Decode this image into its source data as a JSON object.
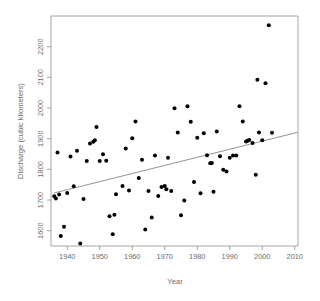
{
  "chart_data": {
    "type": "scatter",
    "title": "",
    "xlabel": "Year",
    "ylabel": "Discharge (cubic kilometers)",
    "xlim": [
      1935,
      2011
    ],
    "ylim": [
      1550,
      2300
    ],
    "grid": false,
    "legend": null,
    "xticks": [
      1940,
      1950,
      1960,
      1970,
      1980,
      1990,
      2000,
      2010
    ],
    "xtick_labels": [
      "1940",
      "1950",
      "1960",
      "1970",
      "1980",
      "1990",
      "2000",
      "2010"
    ],
    "yticks": [
      1600,
      1700,
      1800,
      1900,
      2000,
      2100,
      2200
    ],
    "ytick_labels": [
      "1600",
      "1700",
      "1800",
      "1900",
      "2000",
      "2100",
      "2200"
    ],
    "point_color": "#000000",
    "point_size": 2.0,
    "trend": {
      "name": "linear-regression-line",
      "color": "#777777",
      "x_start": 1936,
      "y_start": 1723,
      "x_end": 2011,
      "y_end": 1921
    },
    "x": [
      1936,
      1936.5,
      1937,
      1937.5,
      1938,
      1939,
      1940,
      1941,
      1942,
      1943,
      1944,
      1945,
      1946,
      1947,
      1948,
      1948.5,
      1949,
      1950,
      1951,
      1952,
      1953,
      1954,
      1954.5,
      1955,
      1957,
      1958,
      1959,
      1960,
      1961,
      1962,
      1963,
      1964,
      1965,
      1966,
      1967,
      1968,
      1969,
      1970,
      1970.5,
      1971,
      1972,
      1973,
      1974,
      1975,
      1976,
      1977,
      1978,
      1979,
      1980,
      1981,
      1982,
      1983,
      1984,
      1984.5,
      1985,
      1986,
      1987,
      1988,
      1989,
      1990,
      1991,
      1992,
      1993,
      1994,
      1995,
      1995.5,
      1996,
      1997,
      1998,
      1998.5,
      1999,
      2000,
      2001,
      2002,
      2003,
      2004,
      2005,
      2006,
      2007,
      2007.5
    ],
    "y": [
      1712,
      1705,
      1855,
      1718,
      1583,
      1613,
      1723,
      1842,
      1745,
      1861,
      1558,
      1703,
      1827,
      1884,
      1890,
      1895,
      1938,
      1827,
      1849,
      1828,
      1647,
      1588,
      1652,
      1719,
      1746,
      1868,
      1731,
      1901,
      1956,
      1772,
      1831,
      1604,
      1729,
      1643,
      1845,
      1713,
      1742,
      1746,
      1735,
      1838,
      1729,
      1999,
      1920,
      1650,
      1698,
      2006,
      1955,
      1759,
      1903,
      1722,
      1918,
      1846,
      1820,
      1821,
      1727,
      1923,
      1843,
      1799,
      1793,
      1838,
      1845,
      1845,
      2006,
      1956,
      1891,
      1893,
      1896,
      1886,
      1782,
      2092,
      1920,
      1895,
      2081,
      2270,
      1919
    ]
  }
}
